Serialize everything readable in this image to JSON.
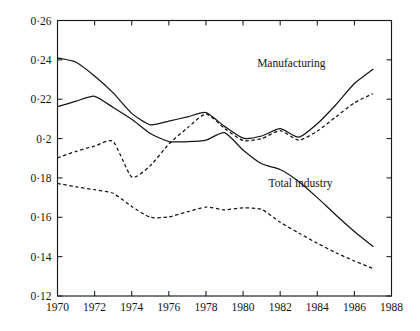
{
  "chart_data": {
    "type": "line",
    "title": "",
    "subtitle": "",
    "xlabel": "",
    "ylabel": "",
    "xlim": [
      1970,
      1988
    ],
    "ylim": [
      0.12,
      0.26
    ],
    "grid": false,
    "legend_position": "inline-annotations",
    "x_tick_labels": [
      "1970",
      "1972",
      "1974",
      "1976",
      "1978",
      "1980",
      "1982",
      "1984",
      "1986",
      "1988"
    ],
    "x_ticks": [
      1970,
      1972,
      1974,
      1976,
      1978,
      1980,
      1982,
      1984,
      1986,
      1988
    ],
    "y_tick_labels": [
      "0·12",
      "0·14",
      "0·16",
      "0·18",
      "0·2",
      "0·22",
      "0·24",
      "0·26"
    ],
    "y_ticks": [
      0.12,
      0.14,
      0.16,
      0.18,
      0.2,
      0.22,
      0.24,
      0.26
    ],
    "annotations": [
      {
        "text": "Manufacturing",
        "x": 1982.6,
        "y": 0.2385
      },
      {
        "text": "Total industry",
        "x": 1983.1,
        "y": 0.1772
      }
    ],
    "x": [
      1970,
      1971,
      1972,
      1973,
      1974,
      1975,
      1976,
      1977,
      1978,
      1979,
      1980,
      1981,
      1982,
      1983,
      1984,
      1985,
      1986,
      1987
    ],
    "series": [
      {
        "name": "Manufacturing (solid)",
        "style": "solid",
        "color": "#151515",
        "values": [
          0.241,
          0.2388,
          0.2318,
          0.2232,
          0.2128,
          0.207,
          0.2089,
          0.211,
          0.2132,
          0.2062,
          0.2002,
          0.2013,
          0.205,
          0.2007,
          0.2075,
          0.2172,
          0.228,
          0.2352
        ]
      },
      {
        "name": "Manufacturing (dashed)",
        "style": "dashed",
        "color": "#151515",
        "values": [
          0.1902,
          0.1935,
          0.1962,
          0.1985,
          0.1805,
          0.1862,
          0.1972,
          0.2054,
          0.2125,
          0.2052,
          0.199,
          0.2,
          0.204,
          0.1992,
          0.2038,
          0.211,
          0.2182,
          0.2228
        ]
      },
      {
        "name": "Total industry (solid)",
        "style": "solid",
        "color": "#151515",
        "values": [
          0.2162,
          0.219,
          0.2215,
          0.2158,
          0.2098,
          0.2026,
          0.1985,
          0.1984,
          0.1992,
          0.203,
          0.1942,
          0.1872,
          0.1843,
          0.1782,
          0.17,
          0.1612,
          0.1528,
          0.1452
        ]
      },
      {
        "name": "Total industry (dashed)",
        "style": "dashed",
        "color": "#151515",
        "values": [
          0.1772,
          0.1755,
          0.174,
          0.1722,
          0.1655,
          0.16,
          0.1602,
          0.1628,
          0.1652,
          0.1638,
          0.1648,
          0.164,
          0.1575,
          0.152,
          0.1468,
          0.142,
          0.1378,
          0.134
        ]
      }
    ]
  }
}
